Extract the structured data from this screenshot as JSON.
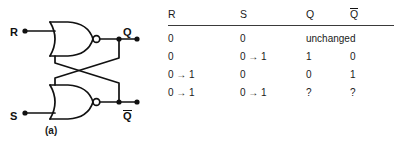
{
  "figure": {
    "panel_a": {
      "caption": "(a)",
      "description": "cross-coupled NOR gate SR latch",
      "inputs": [
        {
          "label": "R",
          "name": "reset-input"
        },
        {
          "label": "S",
          "name": "set-input"
        }
      ],
      "outputs": [
        {
          "label": "Q",
          "overline": false,
          "name": "q-output"
        },
        {
          "label": "Q",
          "overline": true,
          "name": "q-bar-output"
        }
      ],
      "gates": [
        {
          "type": "NOR",
          "name": "nor-gate-top"
        },
        {
          "type": "NOR",
          "name": "nor-gate-bottom"
        }
      ]
    },
    "panel_b": {
      "caption": "(b)",
      "table": {
        "headers": [
          {
            "text": "R",
            "overline": false
          },
          {
            "text": "S",
            "overline": false
          },
          {
            "text": "Q",
            "overline": false
          },
          {
            "text": "Q",
            "overline": true
          }
        ],
        "rows": [
          {
            "r": "0",
            "s": "0",
            "q": "unchanged",
            "qbar": "",
            "span_q": true
          },
          {
            "r": "0",
            "s": "0 → 1",
            "q": "1",
            "qbar": "0",
            "span_q": false
          },
          {
            "r": "0 → 1",
            "s": "0",
            "q": "0",
            "qbar": "1",
            "span_q": false
          },
          {
            "r": "0 → 1",
            "s": "0 → 1",
            "q": "?",
            "qbar": "?",
            "span_q": false
          }
        ]
      }
    }
  },
  "colors": {
    "ink": "#1a1a1a",
    "rule": "#3a3a3a",
    "background": "#ffffff"
  }
}
